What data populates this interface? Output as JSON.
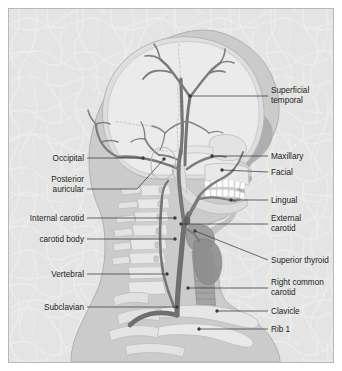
{
  "figure": {
    "view": "right lateral",
    "background_color": "#e4e4e4",
    "frame_border_color": "#b8b8b8",
    "page_color": "#ffffff",
    "artery_color": "#7b7b7b",
    "artery_dark_color": "#6a6a6a",
    "bone_color": "#e9e9e9",
    "soft_tissue_color": "#c9c9c9",
    "label_color": "#231f20",
    "leader_color": "#3a3a3a",
    "tooth_color": "#fdfdfd"
  },
  "labels": {
    "right": [
      {
        "id": "superficial-temporal",
        "lines": [
          "Superficial",
          "temporal"
        ],
        "x": 262,
        "y": 84,
        "leader": {
          "x1": 259,
          "y1": 87,
          "x2": 181,
          "y2": 87
        },
        "dot": {
          "x": 181,
          "y": 87
        }
      },
      {
        "id": "maxillary",
        "lines": [
          "Maxillary"
        ],
        "x": 262,
        "y": 150,
        "leader": {
          "x1": 259,
          "y1": 147,
          "x2": 203,
          "y2": 147
        },
        "dot": {
          "x": 203,
          "y": 147
        }
      },
      {
        "id": "facial",
        "lines": [
          "Facial"
        ],
        "x": 262,
        "y": 166,
        "leader": {
          "x1": 259,
          "y1": 163,
          "x2": 213,
          "y2": 161
        },
        "dot": {
          "x": 213,
          "y": 161
        }
      },
      {
        "id": "lingual",
        "lines": [
          "Lingual"
        ],
        "x": 262,
        "y": 194,
        "leader": {
          "x1": 259,
          "y1": 191,
          "x2": 222,
          "y2": 191
        },
        "dot": {
          "x": 222,
          "y": 191
        }
      },
      {
        "id": "external-carotid",
        "lines": [
          "External",
          "carotid"
        ],
        "x": 262,
        "y": 212,
        "leader": {
          "x1": 259,
          "y1": 215,
          "x2": 172,
          "y2": 215
        },
        "dot": {
          "x": 172,
          "y": 215
        }
      },
      {
        "id": "superior-thyroid",
        "lines": [
          "Superior thyroid"
        ],
        "x": 262,
        "y": 254,
        "leader": {
          "x1": 259,
          "y1": 251,
          "x2": 186,
          "y2": 222
        },
        "dot": {
          "x": 186,
          "y": 222
        }
      },
      {
        "id": "right-common-carotid",
        "lines": [
          "Right common",
          "carotid"
        ],
        "x": 262,
        "y": 276,
        "leader": {
          "x1": 259,
          "y1": 279,
          "x2": 179,
          "y2": 279
        },
        "dot": {
          "x": 179,
          "y": 279
        }
      },
      {
        "id": "clavicle",
        "lines": [
          "Clavicle"
        ],
        "x": 262,
        "y": 305,
        "leader": {
          "x1": 259,
          "y1": 302,
          "x2": 208,
          "y2": 302
        },
        "dot": {
          "x": 208,
          "y": 302
        }
      },
      {
        "id": "rib-1",
        "lines": [
          "Rib 1"
        ],
        "x": 262,
        "y": 323,
        "leader": {
          "x1": 259,
          "y1": 320,
          "x2": 190,
          "y2": 320
        },
        "dot": {
          "x": 190,
          "y": 320
        }
      }
    ],
    "left": [
      {
        "id": "occipital",
        "lines": [
          "Occipital"
        ],
        "x": 75,
        "y": 152,
        "leader": {
          "x1": 78,
          "y1": 149,
          "x2": 134,
          "y2": 149
        },
        "dot": {
          "x": 134,
          "y": 149
        }
      },
      {
        "id": "posterior-auricular",
        "lines": [
          "Posterior",
          "auricular"
        ],
        "x": 75,
        "y": 173,
        "leader": {
          "x1": 78,
          "y1": 180,
          "x2": 128,
          "y2": 180
        },
        "dot": {
          "x": 155,
          "y": 150
        },
        "elbow": {
          "x": 128,
          "y": 180
        }
      },
      {
        "id": "internal-carotid",
        "lines": [
          "Internal carotid"
        ],
        "x": 75,
        "y": 212,
        "leader": {
          "x1": 78,
          "y1": 209,
          "x2": 166,
          "y2": 209
        },
        "dot": {
          "x": 166,
          "y": 209
        }
      },
      {
        "id": "carotid-body",
        "lines": [
          "carotid body"
        ],
        "x": 75,
        "y": 233,
        "leader": {
          "x1": 78,
          "y1": 230,
          "x2": 166,
          "y2": 230
        },
        "dot": {
          "x": 166,
          "y": 230
        }
      },
      {
        "id": "vertebral",
        "lines": [
          "Vertebral"
        ],
        "x": 75,
        "y": 268,
        "leader": {
          "x1": 78,
          "y1": 265,
          "x2": 158,
          "y2": 265
        },
        "dot": {
          "x": 158,
          "y": 265
        }
      },
      {
        "id": "subclavian",
        "lines": [
          "Subclavian"
        ],
        "x": 75,
        "y": 301,
        "leader": {
          "x1": 78,
          "y1": 298,
          "x2": 168,
          "y2": 298
        },
        "dot": {
          "x": 168,
          "y": 298
        }
      }
    ]
  }
}
